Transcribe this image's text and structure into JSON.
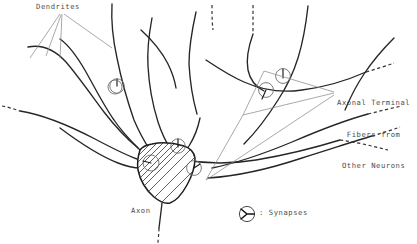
{
  "diagram": {
    "background_color": "#ffffff",
    "ink_color": "#262626",
    "label_color": "#4c4c4c",
    "labels": {
      "dendrites": "Dendrites",
      "axon": "Axon",
      "axonal_terminal_line1": "Axonal Terminal",
      "axonal_terminal_line2": "Fibers from",
      "axonal_terminal_line3": "Other Neurons",
      "legend_synapses": ": Synapses"
    },
    "parts": {
      "soma": "cell body with diagonal hatching",
      "dendrite_count": 6,
      "synapse_count": 7,
      "axon": "single descending fiber ending in dashes"
    }
  }
}
